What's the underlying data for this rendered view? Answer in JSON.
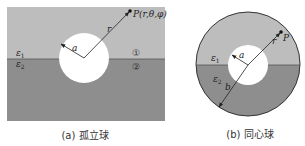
{
  "figure": {
    "colors": {
      "upper_medium": "#bdbdbd",
      "lower_medium": "#8e8e8e",
      "sphere": "#ffffff",
      "line": "#222222"
    },
    "panel_a": {
      "caption": "(a) 孤立球",
      "point_label": "P(r,θ,φ)",
      "radius_label": "a",
      "distance_label": "r",
      "eps1_base": "ε",
      "eps1_sub": "1",
      "eps2_base": "ε",
      "eps2_sub": "2",
      "region1_marker": "①",
      "region2_marker": "②"
    },
    "panel_b": {
      "caption": "(b) 同心球",
      "point_label": "P",
      "inner_radius_label": "a",
      "outer_radius_label": "b",
      "distance_label": "r",
      "eps1_base": "ε",
      "eps1_sub": "1",
      "eps2_base": "ε",
      "eps2_sub": "2"
    }
  }
}
